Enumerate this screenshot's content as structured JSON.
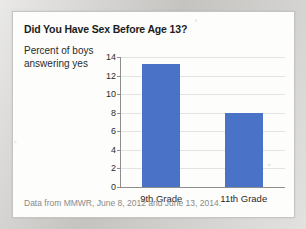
{
  "card": {
    "title": "Did You Have Sex Before Age 13?",
    "axis_caption_line1": "Percent of boys",
    "axis_caption_line2": "answering yes",
    "source_note": "Data from MMWR, June 8, 2012 and June 13, 2014."
  },
  "colors": {
    "bar": "#4a72c7",
    "grid": "#e3e3e3",
    "axis": "#8d8d8d",
    "card_background": "#fdfdfc",
    "page_background": "#cfcecb",
    "title_text": "#1c1c1c",
    "source_text": "#8a8a88"
  },
  "chart_data": {
    "type": "bar",
    "title": "Did You Have Sex Before Age 13?",
    "categories": [
      "9th Grade",
      "11th Grade"
    ],
    "values": [
      13.2,
      8.0
    ],
    "xlabel": "",
    "ylabel": "Percent of boys answering yes",
    "ylim": [
      0,
      14
    ],
    "ytick_labels": [
      "0",
      "2",
      "4",
      "6",
      "8",
      "10",
      "12",
      "14"
    ],
    "ytick_values": [
      0,
      2,
      4,
      6,
      8,
      10,
      12,
      14
    ],
    "grid": "horizontal",
    "legend": "none",
    "series": [
      {
        "name": "Percent of boys answering yes",
        "values": [
          13.2,
          8.0
        ],
        "color": "#4a72c7"
      }
    ],
    "annotations": [
      "Data from MMWR, June 8, 2012 and June 13, 2014."
    ]
  }
}
